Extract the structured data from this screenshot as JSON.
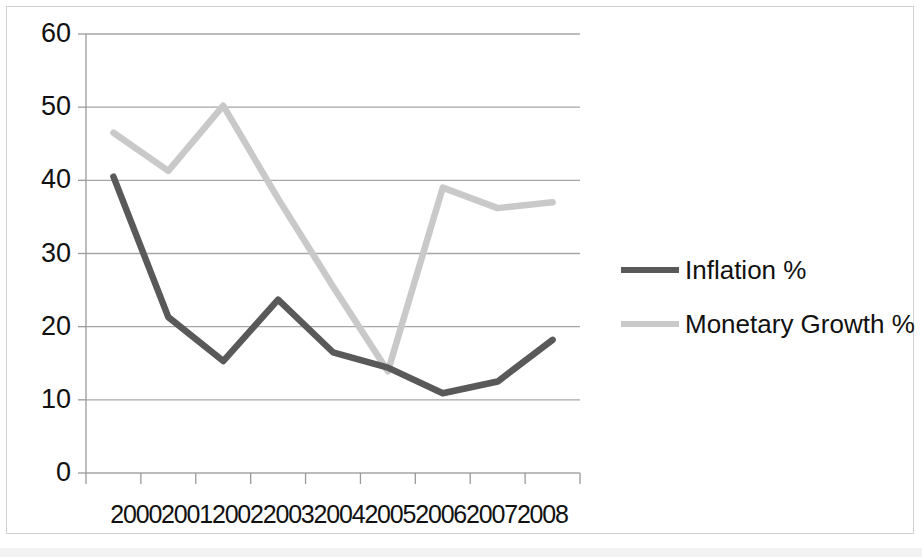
{
  "chart_data": {
    "type": "line",
    "title": "",
    "xlabel": "",
    "ylabel": "",
    "categories": [
      "2000",
      "2001",
      "2002",
      "2003",
      "2004",
      "2005",
      "2006",
      "2007",
      "2008"
    ],
    "series": [
      {
        "name": "Inflation %",
        "color": "#595959",
        "values": [
          40.5,
          21.3,
          15.3,
          23.7,
          16.5,
          14.4,
          10.9,
          12.5,
          18.2
        ]
      },
      {
        "name": "Monetary Growth %",
        "color": "#c9c9c9",
        "values": [
          46.5,
          41.3,
          50.2,
          37.5,
          25.5,
          13.9,
          39.0,
          36.2,
          37.0
        ]
      }
    ],
    "ylim": [
      0,
      60
    ],
    "ytick_values": [
      0,
      10,
      20,
      30,
      40,
      50,
      60
    ],
    "ytick_labels": [
      "0",
      "10",
      "20",
      "30",
      "40",
      "50",
      "60"
    ],
    "grid": true,
    "grid_axis": "y",
    "legend_position": "right",
    "axis_color": "#9a9a9a",
    "grid_color": "#a6a6a6",
    "plot_background": "#ffffff"
  },
  "legend": {
    "entries": [
      {
        "label": "Inflation %"
      },
      {
        "label": "Monetary Growth %"
      }
    ]
  }
}
